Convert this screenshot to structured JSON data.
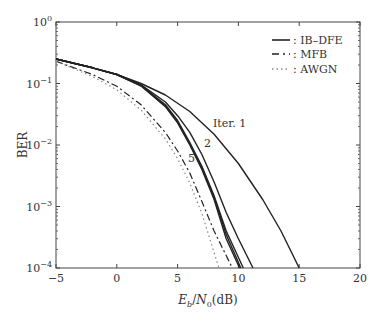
{
  "chart_data": {
    "type": "line",
    "title": "",
    "xlabel": "E_b/N_0(dB)",
    "ylabel": "BER",
    "xlim": [
      -5,
      20
    ],
    "ylim": [
      0.0001,
      1
    ],
    "yscale": "log",
    "x_ticks": [
      -5,
      0,
      5,
      10,
      15,
      20
    ],
    "y_ticks": [
      "10^0",
      "10^-1",
      "10^-2",
      "10^-3",
      "10^-4"
    ],
    "grid": false,
    "legend_position": "upper right",
    "legend": [
      {
        "label": ": IB–DFE",
        "style": "solid"
      },
      {
        "label": ": MFB",
        "style": "dash-dot"
      },
      {
        "label": ": AWGN",
        "style": "dotted"
      }
    ],
    "annotations": [
      "Iter. 1",
      "2",
      "5"
    ],
    "series": [
      {
        "name": "IB-DFE Iter. 1",
        "style": "solid",
        "x": [
          -5,
          -2,
          0,
          2,
          4,
          6,
          8,
          10,
          12,
          13.5,
          15
        ],
        "y": [
          0.25,
          0.18,
          0.14,
          0.1,
          0.065,
          0.035,
          0.015,
          0.005,
          0.0013,
          0.0004,
          0.0001
        ]
      },
      {
        "name": "IB-DFE Iter. 2",
        "style": "solid",
        "x": [
          -5,
          -2,
          0,
          2,
          4,
          5,
          6,
          7,
          8,
          9,
          10,
          11.2
        ],
        "y": [
          0.25,
          0.18,
          0.14,
          0.095,
          0.05,
          0.03,
          0.016,
          0.007,
          0.0025,
          0.0008,
          0.0003,
          0.0001
        ]
      },
      {
        "name": "IB-DFE Iter. 3",
        "style": "solid",
        "x": [
          -5,
          -2,
          0,
          2,
          4,
          5,
          6,
          7,
          8,
          9,
          10.4
        ],
        "y": [
          0.25,
          0.18,
          0.14,
          0.093,
          0.045,
          0.025,
          0.011,
          0.0045,
          0.0015,
          0.0004,
          0.0001
        ]
      },
      {
        "name": "IB-DFE Iter. 4",
        "style": "solid",
        "x": [
          -5,
          -2,
          0,
          2,
          4,
          5,
          6,
          7,
          8,
          9,
          10.2
        ],
        "y": [
          0.25,
          0.18,
          0.14,
          0.092,
          0.043,
          0.024,
          0.0105,
          0.0042,
          0.0014,
          0.00035,
          0.0001
        ]
      },
      {
        "name": "IB-DFE Iter. 5",
        "style": "solid",
        "x": [
          -5,
          -2,
          0,
          2,
          4,
          5,
          6,
          7,
          8,
          9,
          10.1
        ],
        "y": [
          0.25,
          0.18,
          0.14,
          0.091,
          0.042,
          0.023,
          0.01,
          0.004,
          0.0013,
          0.0003,
          0.0001
        ]
      },
      {
        "name": "MFB",
        "style": "dash-dot",
        "x": [
          -5,
          -2,
          0,
          2,
          4,
          5,
          6,
          7,
          8,
          9.5
        ],
        "y": [
          0.23,
          0.14,
          0.09,
          0.045,
          0.016,
          0.008,
          0.0035,
          0.0012,
          0.0004,
          0.0001
        ]
      },
      {
        "name": "AWGN",
        "style": "dotted",
        "x": [
          -5,
          -2,
          0,
          2,
          4,
          5,
          6,
          7,
          8.4
        ],
        "y": [
          0.23,
          0.13,
          0.079,
          0.037,
          0.0125,
          0.006,
          0.0024,
          0.00077,
          0.0001
        ]
      }
    ]
  }
}
